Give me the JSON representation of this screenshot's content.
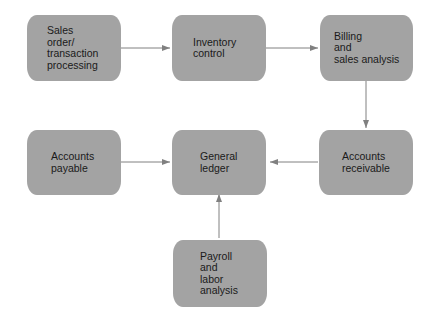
{
  "diagram": {
    "nodes": [
      {
        "id": "sales",
        "label": "Sales\norder/\ntransaction\nprocessing"
      },
      {
        "id": "inventory",
        "label": "Inventory\ncontrol"
      },
      {
        "id": "billing",
        "label": "Billing\nand\nsales analysis"
      },
      {
        "id": "payable",
        "label": "Accounts\npayable"
      },
      {
        "id": "ledger",
        "label": "General\nledger"
      },
      {
        "id": "receivable",
        "label": "Accounts\nreceivable"
      },
      {
        "id": "payroll",
        "label": "Payroll\nand\nlabor\nanalysis"
      }
    ],
    "edges": [
      {
        "from": "sales",
        "to": "inventory"
      },
      {
        "from": "inventory",
        "to": "billing"
      },
      {
        "from": "billing",
        "to": "receivable"
      },
      {
        "from": "receivable",
        "to": "ledger"
      },
      {
        "from": "payable",
        "to": "ledger"
      },
      {
        "from": "payroll",
        "to": "ledger"
      }
    ],
    "colors": {
      "box": "#a3a3a3",
      "arrow": "#808080",
      "text": "#1a1a1a"
    }
  }
}
